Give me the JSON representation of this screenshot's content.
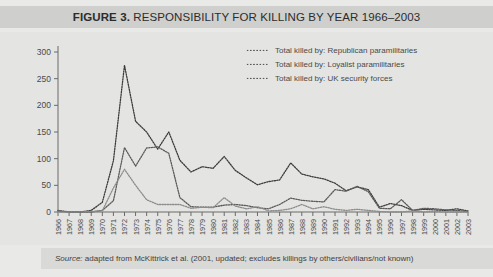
{
  "title": {
    "figure_label": "FIGURE 3.",
    "caption": "RESPONSIBILITY FOR KILLING BY YEAR 1966–2003",
    "full": "FIGURE 3. RESPONSIBILITY FOR KILLING BY YEAR 1966–2003"
  },
  "source": {
    "prefix": "Source:",
    "text": "adapted from McKittrick et al. (2001, updated; excludes killings by others/civilians/not known)"
  },
  "colors": {
    "title_bar": "#cfcfcd",
    "panel": "#e4e4e2",
    "source_bar": "#d9d9d7",
    "series_republican": "#3c3c3c",
    "series_loyalist": "#5a5a5a",
    "series_uk": "#8c8c8c",
    "axis": "#6a6a6a",
    "text": "#3b3b3b"
  },
  "chart_data": {
    "type": "line",
    "title": "FIGURE 3. RESPONSIBILITY FOR KILLING BY YEAR 1966–2003",
    "xlabel": "",
    "ylabel": "",
    "ylim": [
      0,
      300
    ],
    "yticks": [
      0,
      50,
      100,
      150,
      200,
      250,
      300
    ],
    "grid": false,
    "legend_position": "top-right",
    "x": [
      1966,
      1967,
      1968,
      1969,
      1970,
      1971,
      1972,
      1973,
      1974,
      1975,
      1976,
      1977,
      1978,
      1979,
      1980,
      1981,
      1982,
      1983,
      1984,
      1985,
      1986,
      1987,
      1988,
      1989,
      1990,
      1991,
      1992,
      1993,
      1994,
      1995,
      1996,
      1997,
      1998,
      1999,
      2000,
      2001,
      2002,
      2003
    ],
    "categories": [
      "1966",
      "1967",
      "1968",
      "1969",
      "1970",
      "1971",
      "1972",
      "1973",
      "1974",
      "1975",
      "1976",
      "1977",
      "1978",
      "1979",
      "1980",
      "1981",
      "1982",
      "1983",
      "1984",
      "1985",
      "1986",
      "1987",
      "1988",
      "1989",
      "1990",
      "1991",
      "1992",
      "1993",
      "1994",
      "1995",
      "1996",
      "1997",
      "1998",
      "1999",
      "2000",
      "2001",
      "2002",
      "2003"
    ],
    "series": [
      {
        "name": "Total killed by: Republican paramilitaries",
        "marker": "dotted",
        "values": [
          2,
          0,
          0,
          3,
          18,
          96,
          275,
          170,
          150,
          118,
          150,
          97,
          75,
          85,
          82,
          104,
          78,
          64,
          51,
          57,
          60,
          92,
          71,
          66,
          62,
          54,
          40,
          47,
          42,
          9,
          16,
          12,
          3,
          5,
          4,
          3,
          6,
          2
        ]
      },
      {
        "name": "Total killed by: Loyalist paramilitaries",
        "marker": "dotted",
        "values": [
          3,
          0,
          0,
          0,
          3,
          21,
          121,
          86,
          120,
          122,
          110,
          27,
          10,
          9,
          9,
          13,
          14,
          12,
          8,
          6,
          14,
          26,
          22,
          20,
          19,
          42,
          39,
          48,
          38,
          7,
          6,
          23,
          3,
          7,
          6,
          4,
          3,
          1
        ]
      },
      {
        "name": "Total killed by: UK security forces",
        "marker": "dotted",
        "values": [
          0,
          0,
          0,
          1,
          2,
          45,
          80,
          50,
          23,
          14,
          14,
          14,
          7,
          9,
          8,
          27,
          11,
          6,
          10,
          2,
          3,
          6,
          14,
          6,
          10,
          5,
          3,
          5,
          3,
          1,
          0,
          0,
          2,
          0,
          1,
          0,
          0,
          0
        ]
      }
    ]
  },
  "legend": {
    "items": [
      {
        "label": "Total killed by: Republican paramilitaries"
      },
      {
        "label": "Total killed by: Loyalist paramilitaries"
      },
      {
        "label": "Total killed by: UK security forces"
      }
    ]
  }
}
